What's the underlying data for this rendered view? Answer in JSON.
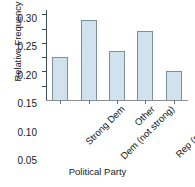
{
  "chart_data": {
    "type": "bar",
    "title": "",
    "xlabel": "Political Party",
    "ylabel": "Relative Frequency",
    "categories": [
      "Strong Dem",
      "Dem (not strong)",
      "Other",
      "Rep (not strong)",
      "Strong Rep"
    ],
    "values": [
      0.15,
      0.28,
      0.17,
      0.24,
      0.1
    ],
    "ylim": [
      0.0,
      0.315
    ],
    "yticks": [
      0.05,
      0.1,
      0.15,
      0.2,
      0.25,
      0.3
    ],
    "ytick_labels": [
      "0.05",
      "0.10",
      "0.15",
      "0.20",
      "0.25",
      "0.30"
    ],
    "grid": false,
    "legend": false,
    "bar_fill_color": "#cfe2ee",
    "bar_edge_color": "#7d8f9b",
    "axis_color": "#3d4d57"
  }
}
